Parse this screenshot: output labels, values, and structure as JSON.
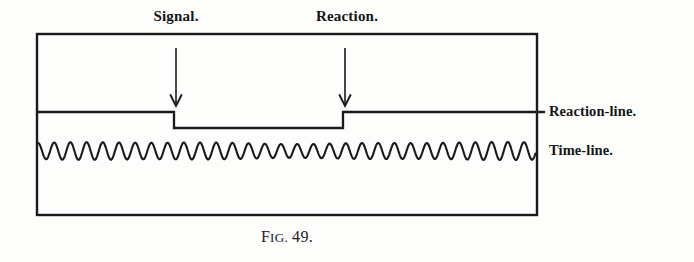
{
  "figure": {
    "caption_prefix_first": "F",
    "caption_prefix_rest": "IG.",
    "caption_number": "49.",
    "caption_full": "FIG. 49."
  },
  "labels": {
    "signal": "Signal.",
    "reaction": "Reaction.",
    "reaction_line": "Reaction-line.",
    "time_line": "Time-line."
  },
  "icons": {
    "signal_arrow": "down-arrow-icon",
    "reaction_arrow": "down-arrow-icon"
  },
  "colors": {
    "ink": "#151515",
    "paper": "#fdfdfc",
    "line": "#1a1a1a"
  },
  "chart_data": {
    "type": "line",
    "title": "FIG. 49.",
    "xlabel": "",
    "ylabel": "",
    "frame": {
      "x": 37,
      "y": 34,
      "width": 500,
      "height": 181
    },
    "series": [
      {
        "name": "Reaction-line",
        "kind": "step",
        "baseline_y": 112,
        "depressed_y": 128,
        "x_start": 37,
        "x_end": 545,
        "step_down_x": 174,
        "step_up_x": 343,
        "points": [
          [
            37,
            112
          ],
          [
            174,
            112
          ],
          [
            174,
            128
          ],
          [
            343,
            128
          ],
          [
            343,
            112
          ],
          [
            545,
            112
          ]
        ]
      },
      {
        "name": "Time-line",
        "kind": "sine",
        "center_y": 151,
        "amplitude": 8,
        "period_px": 16.2,
        "x_start": 38,
        "x_end": 536,
        "cycles": 31
      }
    ],
    "annotations": [
      {
        "label": "Signal.",
        "arrow_x": 176,
        "arrow_top": 48,
        "arrow_bottom": 106
      },
      {
        "label": "Reaction.",
        "arrow_x": 345,
        "arrow_top": 48,
        "arrow_bottom": 106
      }
    ],
    "legend": {
      "position": "right",
      "entries": [
        "Reaction-line.",
        "Time-line."
      ]
    },
    "grid": false
  }
}
